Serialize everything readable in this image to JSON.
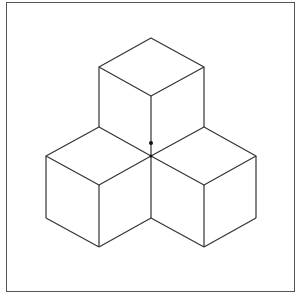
{
  "figure": {
    "line_color": "#333333",
    "frame_color": "#555555",
    "center_dot": {
      "x": 151,
      "y": 143
    },
    "center_vertex": {
      "x": 151,
      "y": 156
    }
  }
}
